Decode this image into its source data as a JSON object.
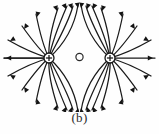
{
  "figure": {
    "caption": "(b)",
    "kind": "electric-field-line-diagram",
    "background_color": "#fefefe",
    "line_color": "#1a1a1a"
  },
  "charges": [
    {
      "id": "left-charge",
      "sign": "+",
      "label": "+",
      "cx": 49,
      "cy": 58,
      "r": 5
    },
    {
      "id": "right-charge",
      "sign": "+",
      "label": "+",
      "cx": 110,
      "cy": 58,
      "r": 5
    }
  ],
  "neutral_point": {
    "id": "null-point",
    "cx": 79.5,
    "cy": 57,
    "r": 3.6
  },
  "chart_data": {
    "type": "scatter",
    "title": "",
    "subtitle": "",
    "xlabel": "",
    "ylabel": "",
    "xlim": [
      0,
      159
    ],
    "ylim": [
      0,
      112
    ],
    "grid": false,
    "legend": null,
    "annotations": [
      "(b)"
    ],
    "sources": [
      {
        "name": "positive charge 1",
        "charge": 1,
        "x": 49,
        "y": 58
      },
      {
        "name": "positive charge 2",
        "charge": 1,
        "x": 110,
        "y": 58
      },
      {
        "name": "neutral point",
        "charge": 0,
        "x": 79.5,
        "y": 57
      }
    ],
    "field_line_count_per_charge": 16,
    "arrow_direction": "outward"
  },
  "field_lines": {
    "left": [
      {
        "d": "M 49 58 L 4 58",
        "arrow": {
          "x": 6,
          "y": 58,
          "angle": 180
        }
      },
      {
        "d": "M 49 58 C 38 55 22 48 8 40",
        "arrow": {
          "x": 10,
          "y": 41,
          "angle": 210
        }
      },
      {
        "d": "M 49 58 C 40 51 32 40 22 26",
        "arrow": {
          "x": 24,
          "y": 29,
          "angle": 234
        }
      },
      {
        "d": "M 49 58 C 44 48 40 34 36 14",
        "arrow": {
          "x": 37,
          "y": 17,
          "angle": 258
        }
      },
      {
        "d": "M 49 58 C 48 44 52 26 58 8",
        "arrow": {
          "x": 57,
          "y": 11,
          "angle": 288
        }
      },
      {
        "d": "M 49 58 C 52 42 60 22 67 6",
        "arrow": {
          "x": 66,
          "y": 9,
          "angle": 294
        }
      },
      {
        "d": "M 49 58 C 56 44 68 24 73 6",
        "arrow": {
          "x": 72,
          "y": 9,
          "angle": 288
        }
      },
      {
        "d": "M 49 58 C 60 48 74 30 78 5",
        "arrow": {
          "x": 78,
          "y": 8,
          "angle": 279
        }
      },
      {
        "d": "M 49 58 L 4 58",
        "arrow": null
      },
      {
        "d": "M 49 58 C 38 61 22 68 8 76",
        "arrow": {
          "x": 10,
          "y": 75,
          "angle": 150
        }
      },
      {
        "d": "M 49 58 C 40 65 32 76 22 90",
        "arrow": {
          "x": 24,
          "y": 87,
          "angle": 126
        }
      },
      {
        "d": "M 49 58 C 44 68 40 82 36 102",
        "arrow": {
          "x": 37,
          "y": 99,
          "angle": 102
        }
      },
      {
        "d": "M 49 58 C 48 72 52 90 58 108",
        "arrow": {
          "x": 57,
          "y": 105,
          "angle": 72
        }
      },
      {
        "d": "M 49 58 C 52 74 60 94 67 110",
        "arrow": {
          "x": 66,
          "y": 107,
          "angle": 66
        }
      },
      {
        "d": "M 49 58 C 56 72 68 92 73 110",
        "arrow": {
          "x": 72,
          "y": 107,
          "angle": 72
        }
      },
      {
        "d": "M 49 58 C 60 68 74 86 78 111",
        "arrow": {
          "x": 78,
          "y": 108,
          "angle": 81
        }
      }
    ],
    "right": [
      {
        "d": "M 110 58 L 155 58",
        "arrow": {
          "x": 153,
          "y": 58,
          "angle": 0
        }
      },
      {
        "d": "M 110 58 C 121 55 137 48 151 40",
        "arrow": {
          "x": 149,
          "y": 41,
          "angle": 330
        }
      },
      {
        "d": "M 110 58 C 119 51 127 40 137 26",
        "arrow": {
          "x": 135,
          "y": 29,
          "angle": 306
        }
      },
      {
        "d": "M 110 58 C 115 48 119 34 123 14",
        "arrow": {
          "x": 122,
          "y": 17,
          "angle": 282
        }
      },
      {
        "d": "M 110 58 C 111 44 107 26 101 8",
        "arrow": {
          "x": 102,
          "y": 11,
          "angle": 252
        }
      },
      {
        "d": "M 110 58 C 107 42 99 22 92 6",
        "arrow": {
          "x": 93,
          "y": 9,
          "angle": 246
        }
      },
      {
        "d": "M 110 58 C 103 44 91 24 86 6",
        "arrow": {
          "x": 87,
          "y": 9,
          "angle": 252
        }
      },
      {
        "d": "M 110 58 C 99 48 85 30 81 5",
        "arrow": {
          "x": 81,
          "y": 8,
          "angle": 261
        }
      },
      {
        "d": "M 110 58 C 121 61 137 68 151 76",
        "arrow": {
          "x": 149,
          "y": 75,
          "angle": 30
        }
      },
      {
        "d": "M 110 58 C 119 65 127 76 137 90",
        "arrow": {
          "x": 135,
          "y": 87,
          "angle": 54
        }
      },
      {
        "d": "M 110 58 C 115 68 119 82 123 102",
        "arrow": {
          "x": 122,
          "y": 99,
          "angle": 78
        }
      },
      {
        "d": "M 110 58 C 111 72 107 90 101 108",
        "arrow": {
          "x": 102,
          "y": 105,
          "angle": 108
        }
      },
      {
        "d": "M 110 58 C 107 74 99 94 92 110",
        "arrow": {
          "x": 93,
          "y": 107,
          "angle": 114
        }
      },
      {
        "d": "M 110 58 C 103 72 91 92 86 110",
        "arrow": {
          "x": 87,
          "y": 107,
          "angle": 108
        }
      },
      {
        "d": "M 110 58 C 99 68 85 86 81 111",
        "arrow": {
          "x": 81,
          "y": 108,
          "angle": 99
        }
      }
    ]
  }
}
